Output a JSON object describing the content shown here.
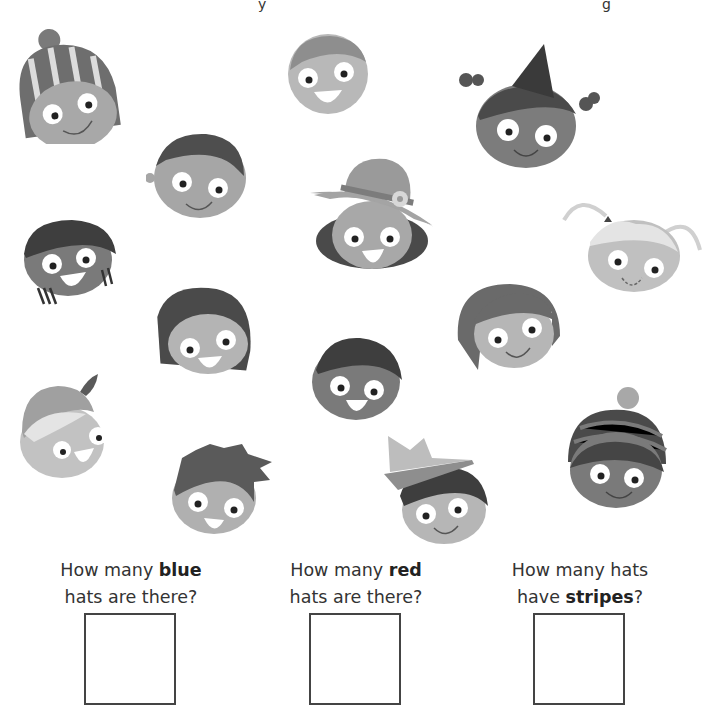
{
  "header": {
    "fragment_left": "y",
    "fragment_right": "g"
  },
  "faces": [
    {
      "id": 1,
      "desc": "striped beanie with pompom"
    },
    {
      "id": 2,
      "desc": "curly short hair boy"
    },
    {
      "id": 3,
      "desc": "light hair boy, no hat"
    },
    {
      "id": 4,
      "desc": "party cone hat, pigtail puffs"
    },
    {
      "id": 5,
      "desc": "braids girl, no hat"
    },
    {
      "id": 6,
      "desc": "sun hat with flower"
    },
    {
      "id": 7,
      "desc": "pigtails with bows, light hair"
    },
    {
      "id": 8,
      "desc": "bob haircut with bangs"
    },
    {
      "id": 9,
      "desc": "short curly dark hair boy"
    },
    {
      "id": 10,
      "desc": "bob haircut, side part"
    },
    {
      "id": 11,
      "desc": "baseball cap, curly light hair"
    },
    {
      "id": 12,
      "desc": "spiky hair boy"
    },
    {
      "id": 13,
      "desc": "paper crown hat"
    },
    {
      "id": 14,
      "desc": "striped knit beanie with pompom"
    }
  ],
  "questions": [
    {
      "pre": "How many ",
      "bold": "blue",
      "post": "",
      "line2_pre": "hats are there?",
      "line2_bold": "",
      "line2_post": ""
    },
    {
      "pre": "How many ",
      "bold": "red",
      "post": "",
      "line2_pre": "hats are there?",
      "line2_bold": "",
      "line2_post": ""
    },
    {
      "pre": "How many hats",
      "bold": "",
      "post": "",
      "line2_pre": "have ",
      "line2_bold": "stripes",
      "line2_post": "?"
    }
  ],
  "colors": {
    "skin_light": "#c4c4c4",
    "skin_mid": "#9a9a9a",
    "skin_dark": "#7c7c7c",
    "hair_dark": "#555555",
    "box_border": "#444444"
  }
}
